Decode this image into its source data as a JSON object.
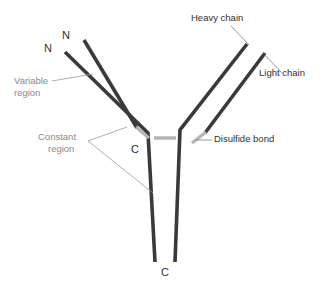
{
  "figure": {
    "background_color": "#ffffff",
    "chain_color": "#3a3a3a",
    "disulfide_color": "#b4b4b4",
    "leader_line_color": "#9a9a9a",
    "dark_text_color": "#2f2f2f",
    "gray_text_color": "#8a8a8a"
  },
  "labels": {
    "n_terminus_outer": "N",
    "n_terminus_inner": "N",
    "variable_region_line1": "Variable",
    "variable_region_line2": "region",
    "constant_region_line1": "Constant",
    "constant_region_line2": "region",
    "heavy_chain": "Heavy chain",
    "light_chain": "Light chain",
    "disulfide_bond": "Disulfide bond",
    "c_terminus_light": "C",
    "c_terminus_heavy": "C"
  },
  "structure": {
    "chains": [
      {
        "name": "heavy-chain-left",
        "type": "heavy",
        "points": "65,52 148,133 155,262"
      },
      {
        "name": "light-chain-left",
        "type": "light",
        "points": "84,40 137,128"
      },
      {
        "name": "heavy-chain-right",
        "type": "heavy",
        "points": "247,44 180,130 175,262"
      },
      {
        "name": "light-chain-right",
        "type": "light",
        "points": "265,53 205,133"
      }
    ],
    "disulfide_bonds": [
      {
        "name": "interchain-hinge-bond",
        "points": "155,138 175,138"
      },
      {
        "name": "heavy-light-bond-left",
        "points": "137,128 148,137"
      },
      {
        "name": "heavy-light-bond-right",
        "points": "205,133 193,142"
      }
    ],
    "leader_lines": [
      {
        "name": "variable-region-leader",
        "points": "52,81 93,74"
      },
      {
        "name": "constant-region-leader-upper",
        "points": "88,141 127,128"
      },
      {
        "name": "constant-region-leader-lower",
        "points": "88,141 152,192"
      },
      {
        "name": "heavy-chain-leader",
        "points": "232,26 249,44"
      },
      {
        "name": "light-chain-leader",
        "points": "263,53 281,72"
      },
      {
        "name": "disulfide-bond-leader",
        "points": "197,139 211,139"
      }
    ]
  }
}
